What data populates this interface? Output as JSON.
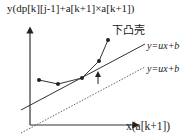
{
  "diagram": {
    "y_axis_label": "y(dp[k][j-1]+a[k+1]×a[k+1])",
    "x_axis_label": "x(a[k+1])",
    "hull_label": "下凸壳",
    "line_upper_label": "y=ux+b",
    "line_lower_label": "y=ux+b",
    "points": [
      [
        39,
        80
      ],
      [
        58,
        84
      ],
      [
        82,
        78
      ],
      [
        99,
        61
      ],
      [
        108,
        40
      ]
    ],
    "colors": {
      "stroke": "#333333",
      "text": "#222222",
      "background": "#ffffff"
    }
  }
}
